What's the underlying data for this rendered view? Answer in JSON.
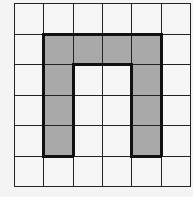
{
  "grid": {
    "rows": 6,
    "cols": 6,
    "shaded_cells": [
      [
        1,
        1
      ],
      [
        1,
        2
      ],
      [
        1,
        3
      ],
      [
        1,
        4
      ],
      [
        2,
        1
      ],
      [
        3,
        1
      ],
      [
        4,
        1
      ],
      [
        2,
        4
      ],
      [
        3,
        4
      ],
      [
        4,
        4
      ]
    ],
    "colors": {
      "shaded": "#a9a9a9",
      "empty": "#f6f6f6",
      "line": "#222222"
    }
  }
}
